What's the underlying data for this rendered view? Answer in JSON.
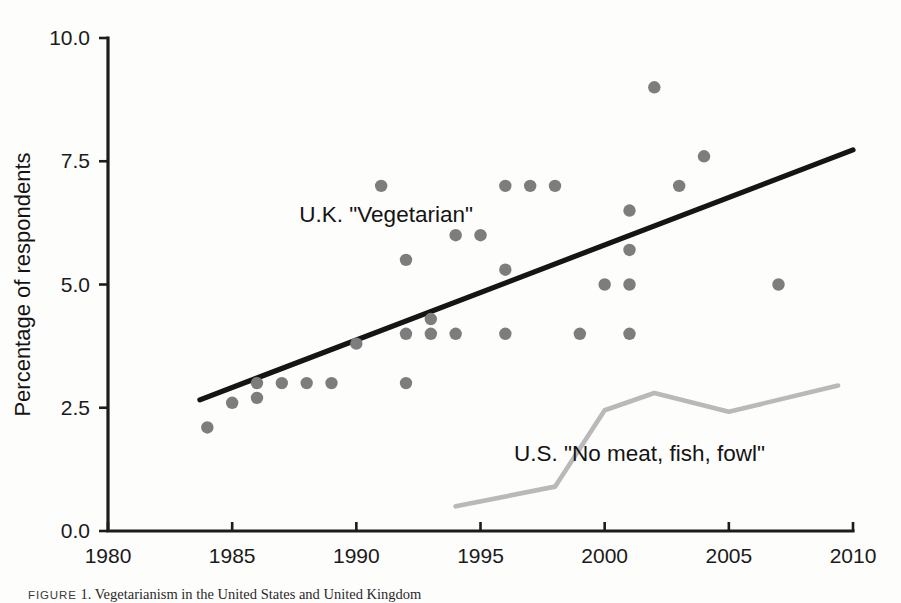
{
  "figure": {
    "caption_label": "FIGURE",
    "caption_number": "1.",
    "caption_text": "Vegetarianism in the United States and United Kingdom"
  },
  "chart_data": {
    "type": "scatter",
    "title": "",
    "xlabel": "",
    "ylabel": "Percentage of respondents",
    "xlim": [
      1980,
      2010
    ],
    "ylim": [
      0.0,
      10.0
    ],
    "xticks": [
      1980,
      1985,
      1990,
      1995,
      2000,
      2005,
      2010
    ],
    "xtick_labels": [
      "1980",
      "1985",
      "1990",
      "1995",
      "2000",
      "2005",
      "2010"
    ],
    "yticks": [
      0.0,
      2.5,
      5.0,
      7.5,
      10.0
    ],
    "ytick_labels": [
      "0.0",
      "2.5",
      "5.0",
      "7.5",
      "10.0"
    ],
    "grid": false,
    "legend_position": "inline-annotations",
    "annotations": [
      {
        "name": "uk-series-label",
        "text": "U.K. \"Vegetarian\"",
        "x": 1991.2,
        "y": 6.27
      },
      {
        "name": "us-series-label",
        "text": "U.S. \"No meat, fish, fowl\"",
        "x": 2001.4,
        "y": 1.42
      }
    ],
    "series": [
      {
        "name": "U.K. \"Vegetarian\"",
        "type": "scatter",
        "color": "#7d7d7d",
        "marker": "circle",
        "points": [
          [
            1984,
            2.1
          ],
          [
            1985,
            2.6
          ],
          [
            1986,
            2.7
          ],
          [
            1986,
            3.0
          ],
          [
            1987,
            3.0
          ],
          [
            1988,
            3.0
          ],
          [
            1989,
            3.0
          ],
          [
            1990,
            3.8
          ],
          [
            1991,
            7.0
          ],
          [
            1992,
            5.5
          ],
          [
            1992,
            4.0
          ],
          [
            1992,
            3.0
          ],
          [
            1993,
            4.3
          ],
          [
            1993,
            4.0
          ],
          [
            1994,
            4.0
          ],
          [
            1994,
            6.0
          ],
          [
            1995,
            6.0
          ],
          [
            1996,
            7.0
          ],
          [
            1996,
            5.3
          ],
          [
            1996,
            4.0
          ],
          [
            1997,
            7.0
          ],
          [
            1998,
            7.0
          ],
          [
            1999,
            4.0
          ],
          [
            2000,
            5.0
          ],
          [
            2001,
            6.5
          ],
          [
            2001,
            5.7
          ],
          [
            2001,
            5.0
          ],
          [
            2001,
            4.0
          ],
          [
            2002,
            9.0
          ],
          [
            2003,
            7.0
          ],
          [
            2004,
            7.6
          ],
          [
            2007,
            5.0
          ]
        ]
      },
      {
        "name": "U.K. trend line",
        "type": "line",
        "color": "#151515",
        "points": [
          [
            1983.7,
            2.66
          ],
          [
            2010.0,
            7.73
          ]
        ]
      },
      {
        "name": "U.S. \"No meat, fish, fowl\"",
        "type": "line",
        "color": "#b9b9b9",
        "points": [
          [
            1994.0,
            0.5
          ],
          [
            1998.0,
            0.9
          ],
          [
            2000.0,
            2.45
          ],
          [
            2002.0,
            2.8
          ],
          [
            2005.0,
            2.42
          ],
          [
            2009.4,
            2.95
          ]
        ]
      }
    ]
  }
}
